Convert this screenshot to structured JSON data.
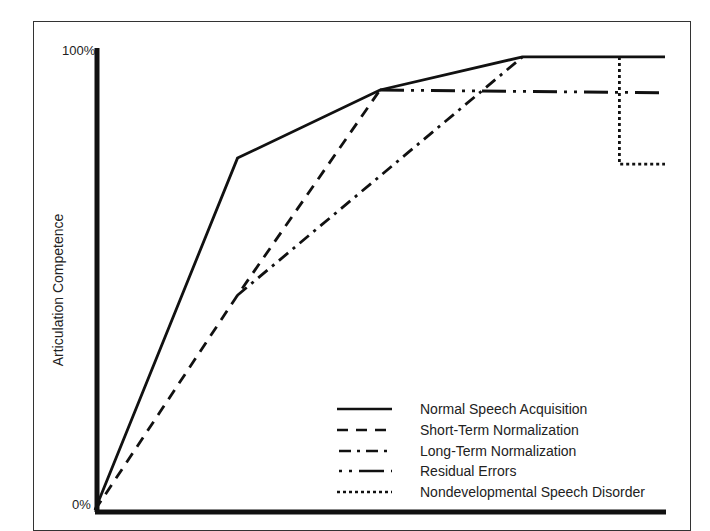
{
  "chart_data": {
    "type": "line",
    "title": "",
    "xlabel": "",
    "ylabel": "Articulation Competence",
    "y_ticks": [
      "0%",
      "100%"
    ],
    "ylim": [
      0,
      100
    ],
    "xlim": [
      0,
      1
    ],
    "grid": false,
    "legend_position": "lower right",
    "series": [
      {
        "name": "Normal Speech Acquisition",
        "style": "solid",
        "points": [
          [
            0,
            0
          ],
          [
            0.25,
            76.5
          ],
          [
            0.5,
            91.3
          ],
          [
            0.75,
            98.5
          ],
          [
            1.0,
            98.5
          ]
        ]
      },
      {
        "name": "Short-Term Normalization",
        "style": "dashed",
        "points": [
          [
            0,
            0
          ],
          [
            0.25,
            46.7
          ],
          [
            0.5,
            91.3
          ]
        ]
      },
      {
        "name": "Long-Term Normalization",
        "style": "dash-dot",
        "points": [
          [
            0.25,
            46.7
          ],
          [
            0.75,
            98.5
          ]
        ]
      },
      {
        "name": "Residual Errors",
        "style": "dash-dot-dot",
        "points": [
          [
            0.5,
            91.3
          ],
          [
            1.0,
            90.7
          ]
        ]
      },
      {
        "name": "Nondevelopmental Speech Disorder",
        "style": "dotted",
        "points": [
          [
            0.92,
            98.5
          ],
          [
            0.92,
            75.2
          ],
          [
            1.0,
            75.2
          ]
        ]
      }
    ]
  },
  "axis": {
    "y_top_label": "100%",
    "y_bottom_label": "0%",
    "y_title": "Articulation Competence"
  },
  "legend": [
    {
      "label": "Normal Speech Acquisition"
    },
    {
      "label": "Short-Term Normalization"
    },
    {
      "label": "Long-Term Normalization"
    },
    {
      "label": "Residual Errors"
    },
    {
      "label": "Nondevelopmental Speech Disorder"
    }
  ]
}
